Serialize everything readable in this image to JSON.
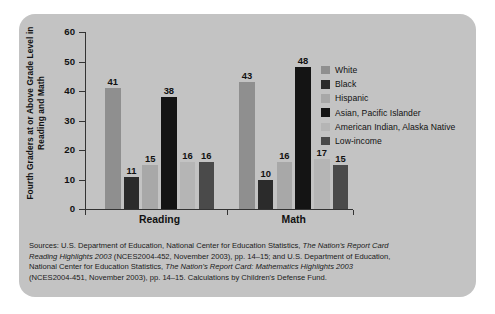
{
  "chart_data": {
    "type": "bar",
    "title": "",
    "xlabel": "",
    "ylabel": "Fourth Graders at or Above Grade Level in Reading and Math",
    "categories": [
      "Reading",
      "Math"
    ],
    "ylim": [
      0,
      60
    ],
    "yticks": [
      0,
      10,
      20,
      30,
      40,
      50,
      60
    ],
    "grid": false,
    "legend_position": "right",
    "series": [
      {
        "name": "White",
        "color": "#8f8f8f",
        "values": [
          41,
          43
        ]
      },
      {
        "name": "Black",
        "color": "#2b2b2b",
        "values": [
          11,
          10
        ]
      },
      {
        "name": "Hispanic",
        "color": "#a8a8a8",
        "values": [
          15,
          16
        ]
      },
      {
        "name": "Asian, Pacific Islander",
        "color": "#141414",
        "values": [
          38,
          48
        ]
      },
      {
        "name": "American Indian, Alaska Native",
        "color": "#b5b5b5",
        "values": [
          16,
          17
        ]
      },
      {
        "name": "Low-income",
        "color": "#4a4a4a",
        "values": [
          16,
          15
        ]
      }
    ]
  },
  "axis": {
    "y_title": "Fourth Graders at or Above Grade Level in Reading and Math",
    "y_labels": [
      "60",
      "50",
      "40",
      "30",
      "20",
      "10",
      "0"
    ]
  },
  "groups": [
    {
      "label": "Reading"
    },
    {
      "label": "Math"
    }
  ],
  "legend": {
    "items": [
      {
        "label": "White"
      },
      {
        "label": "Black"
      },
      {
        "label": "Hispanic"
      },
      {
        "label": "Asian, Pacific Islander"
      },
      {
        "label": "American Indian, Alaska Native"
      },
      {
        "label": "Low-income"
      }
    ]
  },
  "source": {
    "line1_a": "Sources: U.S. Department of Education, National Center for Education Statistics, ",
    "line1_b": "The Nation's Report Card",
    "line2_a": "Reading Highlights 2003",
    "line2_b": " (NCES2004-452, November 2003), pp. 14–15; and U.S. Department of Education,",
    "line3_a": "National Center for Education Statistics, ",
    "line3_b": "The Nation's Report Card: Mathematics Highlights 2003",
    "line4": "(NCES2004-451, November 2003), pp. 14–15. Calculations by Children's Defense Fund."
  },
  "values_labels": {
    "reading": [
      "41",
      "11",
      "15",
      "38",
      "16",
      "16"
    ],
    "math": [
      "43",
      "10",
      "16",
      "48",
      "17",
      "15"
    ]
  }
}
